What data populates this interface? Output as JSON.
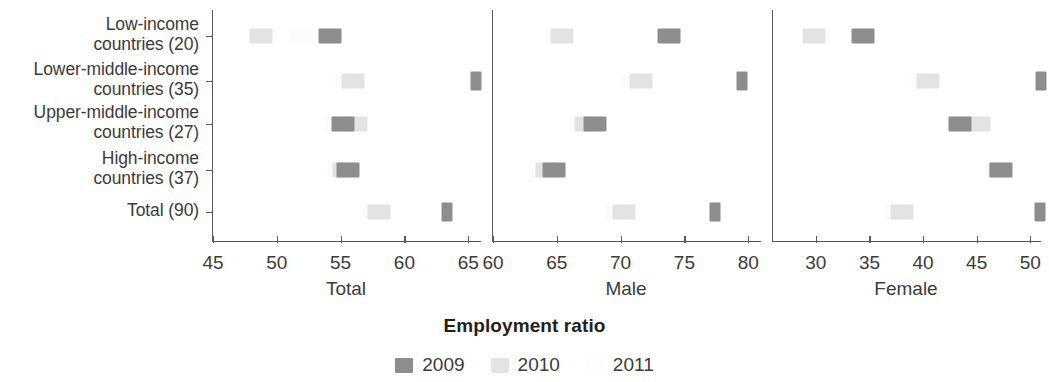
{
  "chart_data": {
    "type": "scatter",
    "title": "",
    "xlabel": "Employment ratio",
    "ylabel": "",
    "grid": false,
    "legend_position": "bottom",
    "categories": [
      "Low-income countries (20)",
      "Lower-middle-income countries (35)",
      "Upper-middle-income countries (27)",
      "High-income countries (37)",
      "Total (90)"
    ],
    "category_lines": [
      [
        "Low-income",
        "countries (20)"
      ],
      [
        "Lower-middle-income",
        "countries (35)"
      ],
      [
        "Upper-middle-income",
        "countries (27)"
      ],
      [
        "High-income",
        "countries (37)"
      ],
      [
        "Total (90)"
      ]
    ],
    "series_names": [
      "2009",
      "2010",
      "2011"
    ],
    "series_colors": [
      "#8d8d8d",
      "#e3e3e3",
      "#fbfbfb"
    ],
    "panels": [
      {
        "name": "Total",
        "xlim": [
          45,
          66
        ],
        "xticks": [
          45,
          50,
          55,
          60,
          65
        ],
        "xticklabels": [
          "45",
          "50",
          "55",
          "60",
          "65"
        ],
        "series": [
          {
            "name": "2009",
            "values": [
              54.2,
              65.6,
              55.2,
              55.6,
              63.3
            ]
          },
          {
            "name": "2010",
            "values": [
              48.8,
              56.0,
              56.2,
              55.3,
              58.0
            ]
          },
          {
            "name": "2011",
            "values": [
              52.0,
              55.5,
              54.6,
              54.9,
              57.5
            ]
          }
        ]
      },
      {
        "name": "Male",
        "xlim": [
          60,
          81
        ],
        "xticks": [
          60,
          65,
          70,
          75,
          80
        ],
        "xticklabels": [
          "60",
          "65",
          "70",
          "75",
          "80"
        ],
        "series": [
          {
            "name": "2009",
            "values": [
              73.8,
              79.5,
              68.0,
              64.8,
              77.4
            ]
          },
          {
            "name": "2010",
            "values": [
              65.4,
              71.6,
              67.3,
              64.2,
              70.3
            ]
          },
          {
            "name": "2011",
            "values": [
              65.0,
              71.0,
              66.9,
              63.7,
              69.8
            ]
          }
        ]
      },
      {
        "name": "Female",
        "xlim": [
          26,
          51
        ],
        "xticks": [
          30,
          35,
          40,
          45,
          50
        ],
        "xticklabels": [
          "30",
          "35",
          "40",
          "45",
          "50"
        ],
        "series": [
          {
            "name": "2009",
            "values": [
              34.4,
              51.0,
              43.4,
              47.3,
              50.9
            ]
          },
          {
            "name": "2010",
            "values": [
              29.8,
              40.5,
              45.2,
              47.2,
              38.0
            ]
          },
          {
            "name": "2011",
            "values": [
              30.2,
              40.0,
              44.8,
              46.8,
              37.6
            ]
          }
        ]
      }
    ]
  },
  "legend": {
    "items": [
      {
        "label": "2009",
        "color": "#8d8d8d"
      },
      {
        "label": "2010",
        "color": "#e3e3e3"
      },
      {
        "label": "2011",
        "color": "#fdfdfd"
      }
    ]
  },
  "axis_title": "Employment ratio"
}
